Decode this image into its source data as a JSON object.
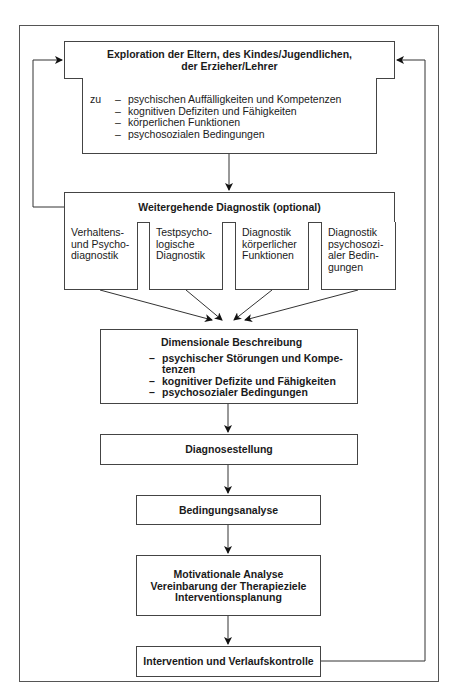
{
  "exploration": {
    "title_line1": "Exploration der Eltern, des Kindes/Jugendlichen,",
    "title_line2": "der Erzieher/Lehrer",
    "prefix": "zu",
    "items": [
      "psychischen Auffälligkeiten und Kompetenzen",
      "kognitiven Defiziten und Fähigkeiten",
      "körperlichen Funktionen",
      "psychosozialen Bedingungen"
    ]
  },
  "further_diagnostics": {
    "title": "Weitergehende Diagnostik (optional)",
    "subboxes": [
      {
        "lines": [
          "Verhaltens-",
          "und Psycho-",
          "diagnostik"
        ]
      },
      {
        "lines": [
          "Testpsycho-",
          "logische",
          "Diagnostik"
        ]
      },
      {
        "lines": [
          "Diagnostik",
          "körperlicher",
          "Funktionen"
        ]
      },
      {
        "lines": [
          "Diagnostik",
          "psychosozi-",
          "aler Bedin-",
          "gungen"
        ]
      }
    ]
  },
  "dimensional": {
    "title": "Dimensionale Beschreibung",
    "items": [
      "psychischer Störungen und Kompe-",
      "kognitiver Defizite und Fähigkeiten",
      "psychosozialer Bedingungen"
    ],
    "item1_cont": "tenzen"
  },
  "diagnosis": {
    "title": "Diagnosestellung"
  },
  "condition_analysis": {
    "title": "Bedingungsanalyse"
  },
  "motivational": {
    "line1": "Motivationale Analyse",
    "line2": "Vereinbarung der Therapieziele",
    "line3": "Interventionsplanung"
  },
  "intervention": {
    "title": "Intervention und Verlaufskontrolle"
  }
}
